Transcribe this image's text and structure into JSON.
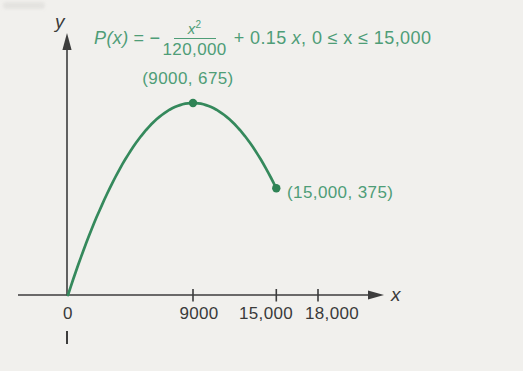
{
  "figure": {
    "background": "#f1f0ed",
    "smudge_color": "#e2e1de",
    "axis_color": "#3d3d3d",
    "text_color": "#3a3a3a"
  },
  "chart_data": {
    "type": "line",
    "xlabel": "x",
    "ylabel": "y",
    "curve_color": "#35895c",
    "point_color": "#2f8355",
    "label_color": "#4e9d77",
    "grid": false,
    "function": {
      "form": "quadratic",
      "a": -8.3333e-06,
      "b": 0.15,
      "c": 0,
      "expression": "P(x) = -x^2/120000 + 0.15x"
    },
    "domain": [
      0,
      15000
    ],
    "x_ticks": [
      {
        "value": 0,
        "label": "0"
      },
      {
        "value": 9000,
        "label": "9000"
      },
      {
        "value": 15000,
        "label": "15,000"
      },
      {
        "value": 18000,
        "label": "18,000"
      }
    ],
    "points": [
      {
        "x": 9000,
        "y": 675,
        "label": "(9000, 675)"
      },
      {
        "x": 15000,
        "y": 375,
        "label": "(15,000, 375)"
      }
    ],
    "equation": {
      "lhs": "P(x)",
      "rel": "=",
      "minus": "−",
      "frac_num_base": "x",
      "frac_num_sup": "2",
      "frac_den": "120,000",
      "mid": "+ 0.15",
      "var": "x",
      "tail": ", 0 ≤ x ≤ 15,000"
    }
  }
}
